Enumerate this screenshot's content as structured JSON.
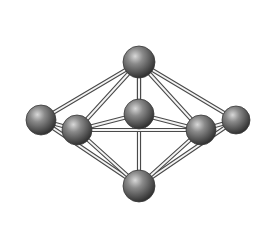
{
  "diagram": {
    "type": "pentagonal-bipyramid-ball-and-stick",
    "colors": {
      "background": "#ffffff",
      "atom_light": "#cfcfcf",
      "atom_mid": "#7a7a7a",
      "atom_dark": "#2e2e2e",
      "rod_edge": "#4a4a4a",
      "rod_fill": "#f4f4f4"
    },
    "atoms": [
      {
        "id": "apex-top",
        "x": 139,
        "y": 62,
        "r": 16
      },
      {
        "id": "equatorial-back-center",
        "x": 139,
        "y": 114,
        "r": 15
      },
      {
        "id": "equatorial-left",
        "x": 41,
        "y": 120,
        "r": 15
      },
      {
        "id": "equatorial-right",
        "x": 236,
        "y": 120,
        "r": 14
      },
      {
        "id": "equatorial-front-left",
        "x": 77,
        "y": 130,
        "r": 15
      },
      {
        "id": "equatorial-front-right",
        "x": 201,
        "y": 130,
        "r": 15
      },
      {
        "id": "apex-bottom",
        "x": 139,
        "y": 186,
        "r": 16
      }
    ],
    "bonds": [
      [
        "apex-top",
        "equatorial-left"
      ],
      [
        "apex-top",
        "equatorial-right"
      ],
      [
        "apex-top",
        "equatorial-front-left"
      ],
      [
        "apex-top",
        "equatorial-front-right"
      ],
      [
        "apex-top",
        "equatorial-back-center"
      ],
      [
        "apex-top",
        "apex-bottom"
      ],
      [
        "apex-bottom",
        "equatorial-left"
      ],
      [
        "apex-bottom",
        "equatorial-right"
      ],
      [
        "apex-bottom",
        "equatorial-front-left"
      ],
      [
        "apex-bottom",
        "equatorial-front-right"
      ],
      [
        "equatorial-left",
        "equatorial-front-left"
      ],
      [
        "equatorial-right",
        "equatorial-front-right"
      ],
      [
        "equatorial-front-left",
        "equatorial-front-right"
      ],
      [
        "equatorial-back-center",
        "equatorial-front-left"
      ],
      [
        "equatorial-back-center",
        "equatorial-front-right"
      ]
    ]
  }
}
